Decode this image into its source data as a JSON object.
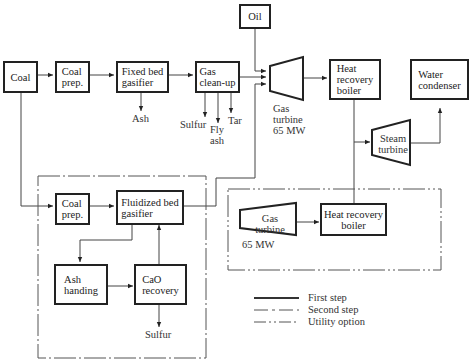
{
  "first_step": {
    "coal": "Coal",
    "coal_prep": "Coal\nprep.",
    "fixed_bed_gasifier": "Fixed bed\ngasifier",
    "ash": "Ash",
    "gas_cleanup": "Gas\nclean-up",
    "sulfur": "Sulfur",
    "fly_ash": "Fly\nash",
    "tar": "Tar",
    "oil": "Oil",
    "gas_turbine": "Gas\nturbine\n65 MW",
    "heat_recovery_boiler": "Heat\nrecovery\nboiler",
    "water_condenser": "Water\ncondenser",
    "steam_turbine": "Steam\nturbine"
  },
  "second_step": {
    "coal_prep": "Coal\nprep.",
    "fluidized_bed_gasifier": "Fluidized bed\ngasifier",
    "ash_handing": "Ash\nhanding",
    "cao_recovery": "CaO\nrecovery",
    "sulfur": "Sulfur"
  },
  "utility_option": {
    "gas_turbine": "Gas\nturbine",
    "gas_turbine_power": "65 MW",
    "heat_recovery_boiler": "Heat recovery\nboiler"
  },
  "legend": {
    "items": [
      {
        "label": "First step",
        "style": "solid"
      },
      {
        "label": "Second step",
        "style": "dash-dot"
      },
      {
        "label": "Utility option",
        "style": "dash-dot-dot"
      }
    ]
  }
}
